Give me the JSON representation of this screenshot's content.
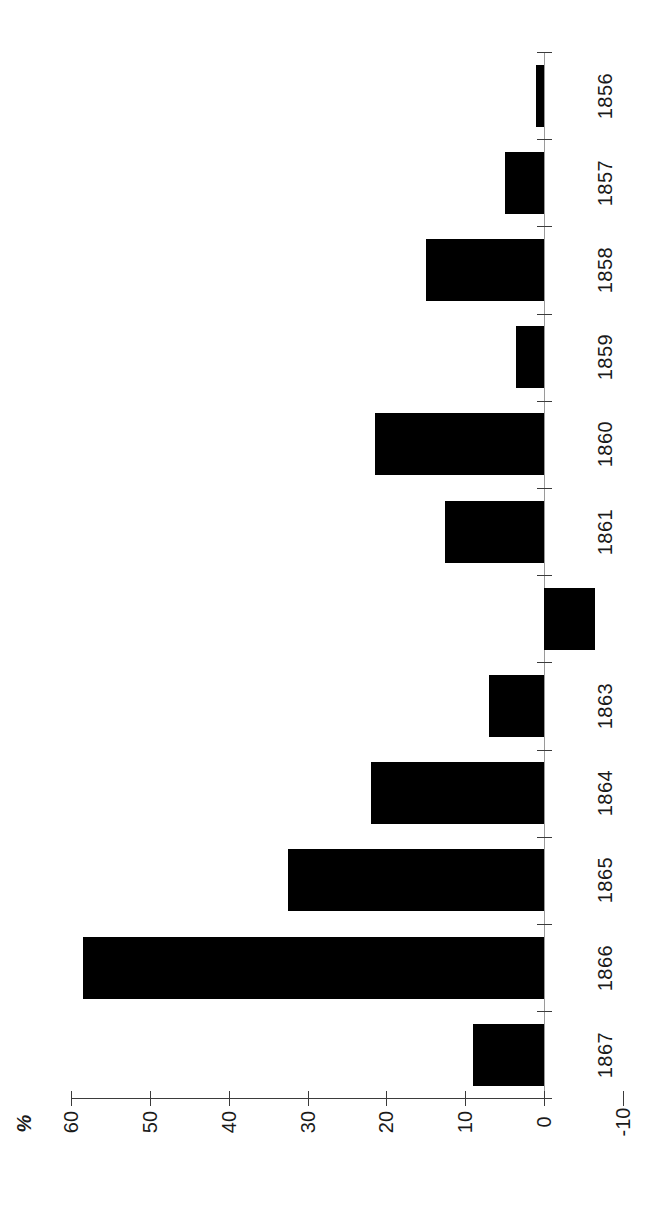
{
  "chart_data": {
    "type": "bar",
    "orientation": "vertical-rotated-90ccw",
    "title": "",
    "subtitle": "",
    "xlabel": "",
    "ylabel": "%",
    "axis_title": "%",
    "categories": [
      "1856",
      "1857",
      "1858",
      "1859",
      "1860",
      "1861",
      "",
      "1863",
      "1864",
      "1865",
      "1866",
      "1867"
    ],
    "values": [
      1,
      5,
      15,
      3.5,
      21.5,
      12.5,
      -6.5,
      7,
      22,
      32.5,
      58.5,
      9
    ],
    "series": [
      {
        "name": "",
        "values": [
          1,
          5,
          15,
          3.5,
          21.5,
          12.5,
          -6.5,
          7,
          22,
          32.5,
          58.5,
          9
        ]
      }
    ],
    "points": [
      {
        "category": "1856",
        "label": "1856",
        "value": 1
      },
      {
        "category": "1857",
        "label": "1857",
        "value": 5
      },
      {
        "category": "1858",
        "label": "1858",
        "value": 15
      },
      {
        "category": "1859",
        "label": "1859",
        "value": 3.5
      },
      {
        "category": "1860",
        "label": "1860",
        "value": 21.5
      },
      {
        "category": "1861",
        "label": "1861",
        "value": 12.5
      },
      {
        "category": "1862",
        "label": "",
        "value": -6.5
      },
      {
        "category": "1863",
        "label": "1863",
        "value": 7
      },
      {
        "category": "1864",
        "label": "1864",
        "value": 22
      },
      {
        "category": "1865",
        "label": "1865",
        "value": 32.5
      },
      {
        "category": "1866",
        "label": "1866",
        "value": 58.5
      },
      {
        "category": "1867",
        "label": "1867",
        "value": 9
      }
    ],
    "ylim": [
      -10,
      60
    ],
    "ytick_labels": [
      "60",
      "50",
      "40",
      "30",
      "20",
      "10",
      "0",
      "-10"
    ],
    "ytick_values": [
      60,
      50,
      40,
      30,
      20,
      10,
      0,
      -10
    ],
    "grid": false,
    "legend": null,
    "legend_position": "none",
    "bar_color": "#000000",
    "axis_color": "#3b3b3b",
    "background_color": "#ffffff"
  }
}
